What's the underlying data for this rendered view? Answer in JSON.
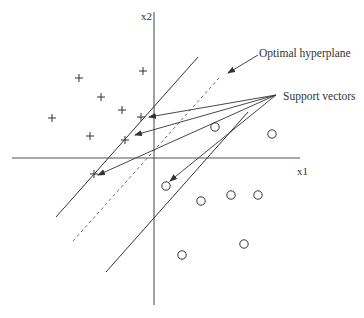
{
  "diagram": {
    "type": "svm-illustration",
    "axes": {
      "x_label": "x1",
      "y_label": "x2",
      "color": "#555555"
    },
    "annotations": {
      "hyperplane_label": "Optimal hyperplane",
      "support_vectors_label": "Support vectors"
    },
    "class_plus": {
      "marker": "+",
      "points": [
        [
          79,
          78
        ],
        [
          101,
          97
        ],
        [
          143,
          71
        ],
        [
          52,
          118
        ],
        [
          122,
          110
        ],
        [
          141,
          117
        ],
        [
          90,
          136
        ],
        [
          125,
          140
        ],
        [
          94,
          174
        ]
      ]
    },
    "class_circle": {
      "marker": "o",
      "points": [
        [
          215,
          127
        ],
        [
          272,
          134
        ],
        [
          166,
          186
        ],
        [
          201,
          201
        ],
        [
          231,
          195
        ],
        [
          258,
          195
        ],
        [
          244,
          244
        ],
        [
          182,
          255
        ]
      ]
    },
    "lines": {
      "margin_upper": [
        [
          56,
          217
        ],
        [
          198,
          57
        ]
      ],
      "optimal_hyperplane": [
        [
          73,
          241
        ],
        [
          219,
          78
        ]
      ],
      "margin_lower": [
        [
          106,
          272
        ],
        [
          248,
          112
        ]
      ]
    },
    "support_vector_arrow_origin": [
      276,
      95
    ],
    "support_vector_targets": [
      [
        147,
        118
      ],
      [
        133,
        136
      ],
      [
        96,
        176
      ],
      [
        168,
        183
      ]
    ],
    "hyperplane_arrow": [
      [
        258,
        55
      ],
      [
        227,
        73
      ]
    ],
    "colors": {
      "ink": "#333333",
      "dashed": "#666666"
    }
  }
}
